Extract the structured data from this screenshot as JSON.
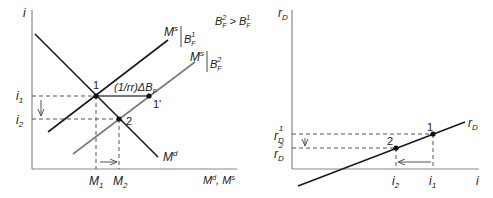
{
  "left_panel": {
    "y_axis_label": "i",
    "x_axis_label": "M^d, M^s",
    "condition": {
      "lhs": "B",
      "lhs_sup": "2",
      "lhs_sub": "F",
      "op": ">",
      "rhs": "B",
      "rhs_sup": "1",
      "rhs_sub": "F"
    },
    "curves": {
      "ms1": {
        "name": "M",
        "sup": "s",
        "cond": "B",
        "cond_sup": "1",
        "cond_sub": "F",
        "color": "#1a1a1a"
      },
      "ms2": {
        "name": "M",
        "sup": "s",
        "cond": "B",
        "cond_sup": "2",
        "cond_sub": "F",
        "color": "#7a7a7a"
      },
      "md": {
        "name": "M",
        "sup": "d",
        "color": "#1a1a1a"
      }
    },
    "shift_label": "(1/rr)ΔB",
    "shift_label_sub": "F",
    "points": {
      "p1": "1",
      "p1prime": "1'",
      "p2": "2"
    },
    "y_ticks": [
      {
        "base": "i",
        "sub": "1"
      },
      {
        "base": "i",
        "sub": "2"
      }
    ],
    "x_ticks": [
      {
        "base": "M",
        "sub": "1"
      },
      {
        "base": "M",
        "sub": "2"
      }
    ]
  },
  "right_panel": {
    "y_axis_label": "r",
    "y_axis_label_sub": "D",
    "x_axis_label": "i",
    "curve": {
      "name": "r",
      "sub": "D",
      "color": "#1a1a1a"
    },
    "points": {
      "p1": "1",
      "p2": "2"
    },
    "y_ticks": [
      {
        "base": "r",
        "sub": "D",
        "sup": "1"
      },
      {
        "base": "r",
        "sub": "D",
        "sup": "2"
      }
    ],
    "x_ticks": [
      {
        "base": "i",
        "sub": "2"
      },
      {
        "base": "i",
        "sub": "1"
      }
    ]
  }
}
